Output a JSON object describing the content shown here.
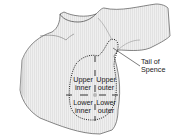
{
  "figure": {
    "quadrants": [
      {
        "id": "upper-inner",
        "line1": "Upper",
        "line2": "inner"
      },
      {
        "id": "upper-outer",
        "line1": "Upper",
        "line2": "outer"
      },
      {
        "id": "lower-inner",
        "line1": "Lower",
        "line2": "inner"
      },
      {
        "id": "lower-outer",
        "line1": "Lower",
        "line2": "outer"
      }
    ],
    "callout": {
      "line1": "Tail of",
      "line2": "Spence"
    },
    "colors": {
      "background": "#ffffff",
      "skin_fill": "#eeeeee",
      "skin_shade": "#cfcfcf",
      "outline": "#4a4a4a",
      "dotted_boundary": "#222222",
      "text": "#1a1a1a"
    }
  }
}
